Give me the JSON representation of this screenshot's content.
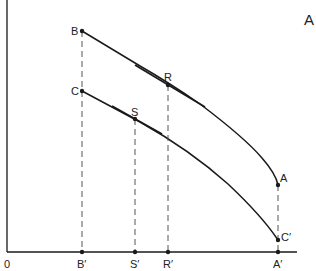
{
  "panel_label": "A",
  "origin_label": "0",
  "points": {
    "B": {
      "label": "B",
      "x": 82,
      "y": 31
    },
    "C": {
      "label": "C",
      "x": 82,
      "y": 91
    },
    "R": {
      "label": "R",
      "x": 168,
      "y": 85
    },
    "S": {
      "label": "S",
      "x": 135,
      "y": 119
    },
    "A": {
      "label": "A",
      "x": 278,
      "y": 185
    },
    "Cp": {
      "label": "C′",
      "x": 278,
      "y": 240
    }
  },
  "axis_ticks": [
    {
      "label": "B′",
      "x": 82
    },
    {
      "label": "S′",
      "x": 135
    },
    {
      "label": "R′",
      "x": 168
    },
    {
      "label": "A′",
      "x": 278
    }
  ],
  "colors": {
    "line": "#1a1a1a",
    "dash": "#555555"
  }
}
